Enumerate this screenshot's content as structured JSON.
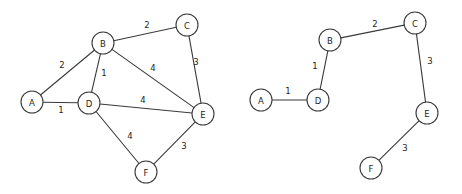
{
  "figure": {
    "background_color": "#ffffff",
    "stroke_color": "#3a3a3a",
    "text_color": "#262626",
    "node_radius": 11
  },
  "chart_data": {
    "type": "diagram",
    "title": "",
    "subtitle": "",
    "xlabel": "",
    "ylabel": "",
    "panels": [
      {
        "name": "original-weighted-graph",
        "caption": "",
        "nodes": [
          {
            "id": "A",
            "label": "A",
            "x": 32,
            "y": 102
          },
          {
            "id": "B",
            "label": "B",
            "x": 103,
            "y": 43
          },
          {
            "id": "C",
            "label": "C",
            "x": 187,
            "y": 25
          },
          {
            "id": "D",
            "label": "D",
            "x": 89,
            "y": 103
          },
          {
            "id": "E",
            "label": "E",
            "x": 203,
            "y": 114
          },
          {
            "id": "F",
            "label": "F",
            "x": 146,
            "y": 172
          }
        ],
        "edges": [
          {
            "from": "A",
            "to": "B",
            "weight": "2",
            "lx": 62,
            "ly": 65
          },
          {
            "from": "A",
            "to": "D",
            "weight": "1",
            "lx": 61,
            "ly": 110
          },
          {
            "from": "B",
            "to": "C",
            "weight": "2",
            "lx": 147,
            "ly": 25
          },
          {
            "from": "B",
            "to": "D",
            "weight": "1",
            "lx": 104,
            "ly": 73
          },
          {
            "from": "B",
            "to": "E",
            "weight": "4",
            "lx": 153,
            "ly": 68
          },
          {
            "from": "C",
            "to": "E",
            "weight": "3",
            "lx": 196,
            "ly": 62
          },
          {
            "from": "D",
            "to": "E",
            "weight": "4",
            "lx": 143,
            "ly": 100
          },
          {
            "from": "D",
            "to": "F",
            "weight": "4",
            "lx": 130,
            "ly": 136
          },
          {
            "from": "E",
            "to": "F",
            "weight": "3",
            "lx": 184,
            "ly": 146
          }
        ]
      },
      {
        "name": "minimum-spanning-tree",
        "caption": "",
        "nodes": [
          {
            "id": "A",
            "label": "A",
            "x": 261,
            "y": 100
          },
          {
            "id": "B",
            "label": "B",
            "x": 330,
            "y": 40
          },
          {
            "id": "C",
            "label": "C",
            "x": 415,
            "y": 23
          },
          {
            "id": "D",
            "label": "D",
            "x": 318,
            "y": 100
          },
          {
            "id": "E",
            "label": "E",
            "x": 427,
            "y": 113
          },
          {
            "id": "F",
            "label": "F",
            "x": 371,
            "y": 168
          }
        ],
        "edges": [
          {
            "from": "A",
            "to": "D",
            "weight": "1",
            "lx": 288,
            "ly": 91
          },
          {
            "from": "B",
            "to": "D",
            "weight": "1",
            "lx": 315,
            "ly": 66
          },
          {
            "from": "B",
            "to": "C",
            "weight": "2",
            "lx": 375,
            "ly": 24
          },
          {
            "from": "C",
            "to": "E",
            "weight": "3",
            "lx": 430,
            "ly": 61
          },
          {
            "from": "E",
            "to": "F",
            "weight": "3",
            "lx": 405,
            "ly": 148
          }
        ]
      }
    ]
  }
}
